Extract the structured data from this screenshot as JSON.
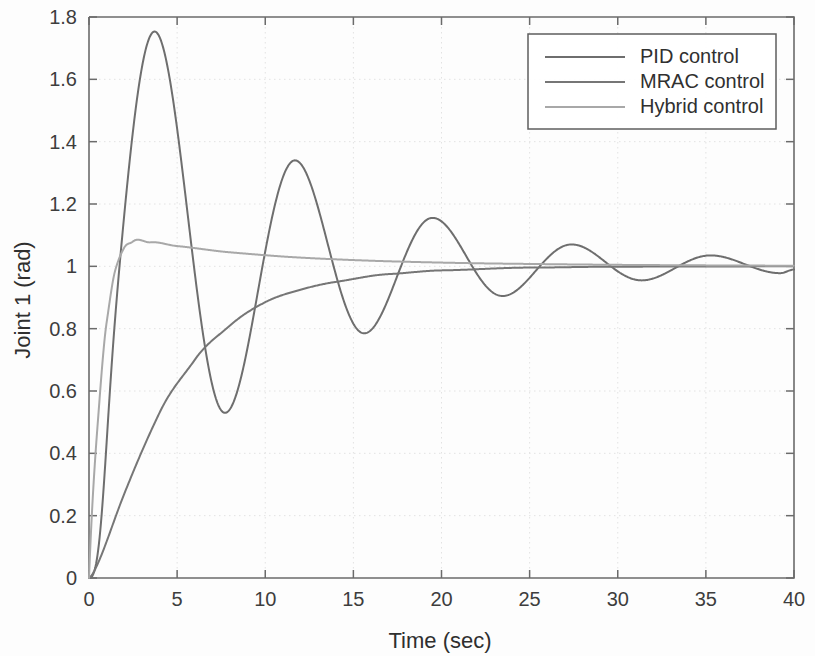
{
  "chart_data": {
    "type": "line",
    "title": "",
    "xlabel": "Time (sec)",
    "ylabel": "Joint 1  (rad)",
    "xlim": [
      0,
      40
    ],
    "ylim": [
      0,
      1.8
    ],
    "grid": true,
    "legend_position": "top-right",
    "x_ticks": [
      "0",
      "5",
      "10",
      "15",
      "20",
      "25",
      "30",
      "35",
      "40"
    ],
    "x_tick_values": [
      0,
      5,
      10,
      15,
      20,
      25,
      30,
      35,
      40
    ],
    "y_ticks": [
      "0",
      "0.2",
      "0.4",
      "0.6",
      "0.8",
      "1",
      "1.2",
      "1.4",
      "1.6",
      "1.8"
    ],
    "y_tick_values": [
      0,
      0.2,
      0.4,
      0.6,
      0.8,
      1.0,
      1.2,
      1.4,
      1.6,
      1.8
    ],
    "series": [
      {
        "name": "PID control",
        "color": "#6e6e6e",
        "width": 2.0,
        "model": "damped_oscillation",
        "params": {
          "final": 1.0,
          "overshoot": 0.755,
          "period": 7.9,
          "decay_tau": 9.0,
          "rise_exp": 2.6,
          "t0": 0.0
        },
        "key_points": [
          {
            "t": 0.0,
            "y": 0.0
          },
          {
            "t": 3.6,
            "y": 1.75
          },
          {
            "t": 7.7,
            "y": 0.53
          },
          {
            "t": 11.7,
            "y": 1.34
          },
          {
            "t": 15.6,
            "y": 0.785
          },
          {
            "t": 19.4,
            "y": 1.155
          },
          {
            "t": 23.4,
            "y": 0.905
          },
          {
            "t": 27.3,
            "y": 1.07
          },
          {
            "t": 31.3,
            "y": 0.955
          },
          {
            "t": 35.2,
            "y": 1.035
          },
          {
            "t": 39.2,
            "y": 0.978
          },
          {
            "t": 40.0,
            "y": 0.99
          }
        ]
      },
      {
        "name": "MRAC control",
        "color": "#767676",
        "width": 2.0,
        "model": "first_order_rise",
        "params": {
          "final": 1.0,
          "tau": 5.2,
          "shape_exp": 1.35
        },
        "key_points": [
          {
            "t": 0.0,
            "y": 0.0
          },
          {
            "t": 2.0,
            "y": 0.27
          },
          {
            "t": 4.0,
            "y": 0.53
          },
          {
            "t": 6.0,
            "y": 0.7
          },
          {
            "t": 8.0,
            "y": 0.81
          },
          {
            "t": 10.0,
            "y": 0.885
          },
          {
            "t": 12.0,
            "y": 0.925
          },
          {
            "t": 14.0,
            "y": 0.95
          },
          {
            "t": 17.0,
            "y": 0.975
          },
          {
            "t": 20.0,
            "y": 0.987
          },
          {
            "t": 25.0,
            "y": 0.996
          },
          {
            "t": 30.0,
            "y": 0.999
          },
          {
            "t": 40.0,
            "y": 1.0
          }
        ]
      },
      {
        "name": "Hybrid control",
        "color": "#a8a8a8",
        "width": 2.0,
        "model": "fast_rise_small_overshoot",
        "params": {
          "final": 1.0,
          "peak": 1.08,
          "peak_time": 2.5,
          "tau_rise": 0.75,
          "tau_settle": 9.0
        },
        "key_points": [
          {
            "t": 0.0,
            "y": 0.0
          },
          {
            "t": 0.5,
            "y": 0.5
          },
          {
            "t": 1.0,
            "y": 0.82
          },
          {
            "t": 1.5,
            "y": 0.99
          },
          {
            "t": 2.0,
            "y": 1.06
          },
          {
            "t": 2.5,
            "y": 1.08
          },
          {
            "t": 3.5,
            "y": 1.077
          },
          {
            "t": 5.0,
            "y": 1.065
          },
          {
            "t": 8.0,
            "y": 1.045
          },
          {
            "t": 12.0,
            "y": 1.028
          },
          {
            "t": 16.0,
            "y": 1.018
          },
          {
            "t": 20.0,
            "y": 1.012
          },
          {
            "t": 26.0,
            "y": 1.007
          },
          {
            "t": 32.0,
            "y": 1.004
          },
          {
            "t": 40.0,
            "y": 1.002
          }
        ]
      }
    ]
  },
  "legend": {
    "entries": [
      {
        "label": "PID control"
      },
      {
        "label": "MRAC control"
      },
      {
        "label": "Hybrid control"
      }
    ]
  }
}
